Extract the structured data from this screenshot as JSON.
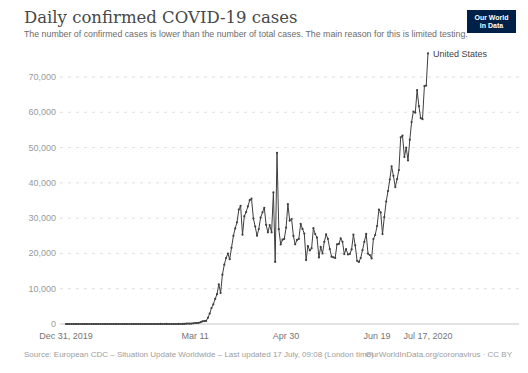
{
  "header": {
    "title": "Daily confirmed COVID-19 cases",
    "subtitle": "The number of confirmed cases is lower than the number of total cases. The main reason for this is limited testing.",
    "logo": {
      "line1": "Our World",
      "line2": "in Data"
    }
  },
  "footer": {
    "source": "Source: European CDC – Situation Update Worldwide – Last updated 17 July, 09:08 (London time)",
    "credit": "OurWorldInData.org/coronavirus · CC BY"
  },
  "colors": {
    "line": "#3f3f3f",
    "grid": "#dedede",
    "axis": "#c8c8c8",
    "y_label": "#999999",
    "x_label": "#757575",
    "series_label": "#3f3f3f",
    "logo_bg": "#002147"
  },
  "chart_data": {
    "type": "line",
    "title": "Daily confirmed COVID-19 cases",
    "xlabel": "",
    "ylabel": "",
    "series_label": "United States",
    "grid": true,
    "ylim": [
      0,
      77000
    ],
    "y_ticks": [
      0,
      10000,
      20000,
      30000,
      40000,
      50000,
      60000,
      70000
    ],
    "x_ticks": [
      {
        "label": "Dec 31, 2019",
        "day": 0
      },
      {
        "label": "Mar 11",
        "day": 71
      },
      {
        "label": "Apr 30",
        "day": 121
      },
      {
        "label": "Jun 19",
        "day": 171
      },
      {
        "label": "Jul 17, 2020",
        "day": 199
      }
    ],
    "x_start_label": "Dec 31, 2019",
    "x_end_label": "Jul 17, 2020",
    "values": [
      0,
      0,
      0,
      0,
      0,
      0,
      0,
      0,
      0,
      0,
      0,
      0,
      0,
      0,
      0,
      0,
      0,
      0,
      0,
      0,
      0,
      1,
      0,
      0,
      1,
      1,
      3,
      0,
      0,
      1,
      0,
      1,
      1,
      0,
      3,
      0,
      1,
      1,
      0,
      0,
      1,
      0,
      1,
      0,
      1,
      1,
      0,
      0,
      1,
      0,
      0,
      1,
      19,
      0,
      0,
      18,
      0,
      6,
      1,
      6,
      8,
      3,
      20,
      14,
      22,
      34,
      74,
      105,
      95,
      121,
      200,
      271,
      287,
      351,
      511,
      777,
      823,
      887,
      1766,
      2988,
      4530,
      5594,
      7123,
      8459,
      11236,
      8789,
      13963,
      16797,
      18695,
      19979,
      18360,
      21595,
      24998,
      27103,
      28819,
      32425,
      33510,
      25316,
      30561,
      31709,
      33323,
      35098,
      35527,
      29861,
      27620,
      25023,
      26922,
      30148,
      31667,
      32922,
      28123,
      25995,
      28065,
      25985,
      37289,
      17588,
      48529,
      26857,
      22541,
      23901,
      24132,
      27326,
      33955,
      29288,
      29763,
      24972,
      22593,
      23841,
      24128,
      28369,
      26957,
      25612,
      18117,
      22048,
      20869,
      21467,
      27143,
      25508,
      24487,
      18873,
      21841,
      19970,
      23285,
      25434,
      24147,
      21236,
      19064,
      18910,
      18721,
      22577,
      22699,
      24266,
      23290,
      19807,
      21222,
      19699,
      19880,
      21140,
      25300,
      22302,
      17919,
      17598,
      18702,
      20922,
      23300,
      25540,
      19920,
      19543,
      18577,
      24084,
      25214,
      27762,
      32411,
      31626,
      25486,
      30256,
      34720,
      37667,
      40949,
      44703,
      41990,
      38800,
      41075,
      43644,
      52898,
      53399,
      47332,
      49970,
      46329,
      52228,
      57236,
      60209,
      59886,
      66281,
      61719,
      58349,
      58034,
      67417,
      67574,
      76678
    ]
  }
}
